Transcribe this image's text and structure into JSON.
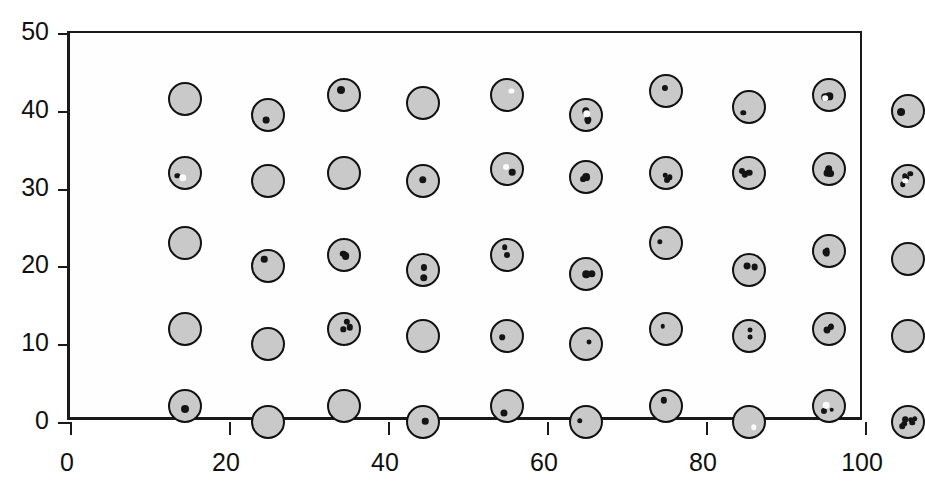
{
  "chart_data": {
    "type": "scatter",
    "title": "",
    "xlabel": "",
    "ylabel": "",
    "xlim": [
      0,
      100
    ],
    "ylim": [
      0,
      50
    ],
    "xticks": [
      0,
      20,
      40,
      60,
      80,
      100
    ],
    "yticks": [
      0,
      10,
      20,
      30,
      40,
      50
    ],
    "grid": false,
    "legend": null,
    "marker_description": "shaded circle containing small dark dots",
    "rows": 5,
    "columns": 10,
    "x_positions": [
      6,
      16.5,
      26,
      36,
      46.5,
      56.5,
      66.5,
      77,
      87,
      97
    ],
    "y_positions": [
      45.5,
      35.5,
      25.5,
      15,
      5.5
    ],
    "points": [
      {
        "x": 6,
        "y": 45.5,
        "dots": 0,
        "white_dots": 0
      },
      {
        "x": 16.5,
        "y": 43.5,
        "dots": 1,
        "white_dots": 0
      },
      {
        "x": 26,
        "y": 46,
        "dots": 1,
        "white_dots": 0
      },
      {
        "x": 36,
        "y": 45,
        "dots": 0,
        "white_dots": 0
      },
      {
        "x": 46.5,
        "y": 46,
        "dots": 0,
        "white_dots": 1
      },
      {
        "x": 56.5,
        "y": 43.5,
        "dots": 3,
        "white_dots": 1
      },
      {
        "x": 66.5,
        "y": 46.5,
        "dots": 1,
        "white_dots": 0
      },
      {
        "x": 77,
        "y": 44.5,
        "dots": 1,
        "white_dots": 0
      },
      {
        "x": 87,
        "y": 46,
        "dots": 2,
        "white_dots": 1
      },
      {
        "x": 97,
        "y": 44,
        "dots": 1,
        "white_dots": 0
      },
      {
        "x": 6,
        "y": 36,
        "dots": 1,
        "white_dots": 1
      },
      {
        "x": 16.5,
        "y": 35,
        "dots": 0,
        "white_dots": 0
      },
      {
        "x": 26,
        "y": 36,
        "dots": 0,
        "white_dots": 0
      },
      {
        "x": 36,
        "y": 35,
        "dots": 1,
        "white_dots": 0
      },
      {
        "x": 46.5,
        "y": 36.5,
        "dots": 1,
        "white_dots": 1
      },
      {
        "x": 56.5,
        "y": 35.5,
        "dots": 2,
        "white_dots": 0
      },
      {
        "x": 66.5,
        "y": 36,
        "dots": 3,
        "white_dots": 0
      },
      {
        "x": 77,
        "y": 36,
        "dots": 3,
        "white_dots": 0
      },
      {
        "x": 87,
        "y": 36.5,
        "dots": 3,
        "white_dots": 0
      },
      {
        "x": 97,
        "y": 35,
        "dots": 4,
        "white_dots": 1
      },
      {
        "x": 6,
        "y": 27,
        "dots": 0,
        "white_dots": 0
      },
      {
        "x": 16.5,
        "y": 24,
        "dots": 1,
        "white_dots": 0
      },
      {
        "x": 26,
        "y": 25.5,
        "dots": 2,
        "white_dots": 0
      },
      {
        "x": 36,
        "y": 23.5,
        "dots": 2,
        "white_dots": 0
      },
      {
        "x": 46.5,
        "y": 25.5,
        "dots": 2,
        "white_dots": 0
      },
      {
        "x": 56.5,
        "y": 23,
        "dots": 2,
        "white_dots": 0
      },
      {
        "x": 66.5,
        "y": 27,
        "dots": 1,
        "white_dots": 0
      },
      {
        "x": 77,
        "y": 23.5,
        "dots": 2,
        "white_dots": 0
      },
      {
        "x": 87,
        "y": 26,
        "dots": 3,
        "white_dots": 0
      },
      {
        "x": 97,
        "y": 25,
        "dots": 0,
        "white_dots": 0
      },
      {
        "x": 6,
        "y": 16,
        "dots": 0,
        "white_dots": 0
      },
      {
        "x": 16.5,
        "y": 14,
        "dots": 0,
        "white_dots": 0
      },
      {
        "x": 26,
        "y": 16,
        "dots": 3,
        "white_dots": 0
      },
      {
        "x": 36,
        "y": 15,
        "dots": 0,
        "white_dots": 0
      },
      {
        "x": 46.5,
        "y": 15,
        "dots": 1,
        "white_dots": 0
      },
      {
        "x": 56.5,
        "y": 14,
        "dots": 1,
        "white_dots": 0
      },
      {
        "x": 66.5,
        "y": 16,
        "dots": 1,
        "white_dots": 0
      },
      {
        "x": 77,
        "y": 15,
        "dots": 2,
        "white_dots": 0
      },
      {
        "x": 87,
        "y": 16,
        "dots": 3,
        "white_dots": 0
      },
      {
        "x": 97,
        "y": 15,
        "dots": 0,
        "white_dots": 0
      },
      {
        "x": 6,
        "y": 6,
        "dots": 1,
        "white_dots": 0
      },
      {
        "x": 16.5,
        "y": 4,
        "dots": 0,
        "white_dots": 0
      },
      {
        "x": 26,
        "y": 6,
        "dots": 0,
        "white_dots": 0
      },
      {
        "x": 36,
        "y": 4,
        "dots": 1,
        "white_dots": 0
      },
      {
        "x": 46.5,
        "y": 6,
        "dots": 1,
        "white_dots": 0
      },
      {
        "x": 56.5,
        "y": 4,
        "dots": 1,
        "white_dots": 0
      },
      {
        "x": 66.5,
        "y": 6,
        "dots": 1,
        "white_dots": 0
      },
      {
        "x": 77,
        "y": 4,
        "dots": 0,
        "white_dots": 1
      },
      {
        "x": 87,
        "y": 6,
        "dots": 2,
        "white_dots": 1
      },
      {
        "x": 97,
        "y": 4,
        "dots": 7,
        "white_dots": 0
      }
    ]
  }
}
